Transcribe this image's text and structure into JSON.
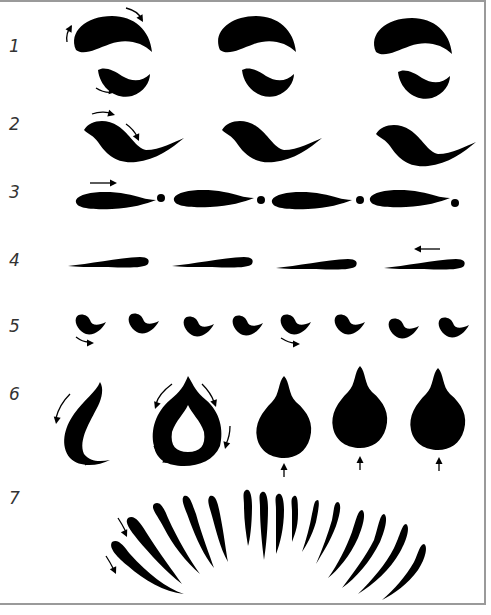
{
  "diagram": {
    "title": "",
    "rows": [
      {
        "label": "1",
        "description": "comma-shaped pairs with rotation arrows",
        "count": 3
      },
      {
        "label": "2",
        "description": "s-curve strokes with directional arrows",
        "count": 3
      },
      {
        "label": "3",
        "description": "tapered strokes alternating with dots",
        "count": 4
      },
      {
        "label": "4",
        "description": "long thin tapered strokes",
        "count": 4
      },
      {
        "label": "5",
        "description": "small crescent strokes",
        "count": 8
      },
      {
        "label": "6",
        "description": "crescent, hollow teardrop, and solid teardrop petals",
        "count": 5
      },
      {
        "label": "7",
        "description": "fan arc of curved strokes",
        "count": 17
      }
    ],
    "colors": {
      "ink": "#000000",
      "frame": "#9a9a9a",
      "label": "#333333",
      "background": "#ffffff"
    }
  }
}
